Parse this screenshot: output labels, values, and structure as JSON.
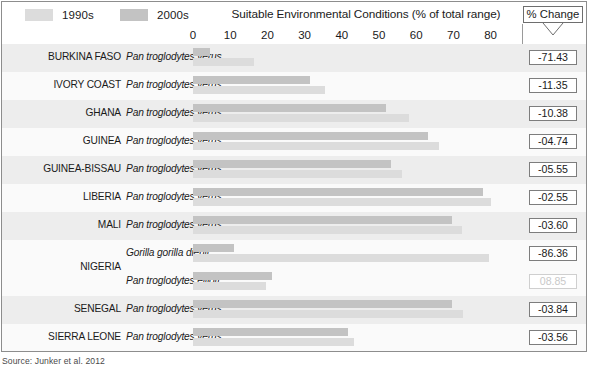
{
  "legend": {
    "items": [
      {
        "label": "1990s",
        "color": "#dcdcdc",
        "icon": "legend-swatch-1990s"
      },
      {
        "label": "2000s",
        "color": "#c3c3c3",
        "icon": "legend-swatch-2000s"
      }
    ]
  },
  "axis": {
    "title": "Suitable Environmental Conditions (% of total range)",
    "ticks": [
      "0",
      "10",
      "20",
      "30",
      "40",
      "50",
      "60",
      "70",
      "80"
    ]
  },
  "pct_column": {
    "header": "% Change",
    "chevron_icon": "chevron-down-icon"
  },
  "source": "Source: Junker et al. 2012",
  "chart_data": {
    "type": "bar",
    "title": "Suitable Environmental Conditions (% of total range)",
    "xlabel": "Suitable Environmental Conditions (% of total range)",
    "ylabel": "",
    "xlim": [
      0,
      80
    ],
    "xticks": [
      0,
      10,
      20,
      30,
      40,
      50,
      60,
      70,
      80
    ],
    "grid": false,
    "orientation": "horizontal",
    "legend": [
      "1990s",
      "2000s"
    ],
    "legend_position": "top-left",
    "series": [
      {
        "name": "1990s",
        "color": "#dcdcdc"
      },
      {
        "name": "2000s",
        "color": "#c3c3c3"
      }
    ],
    "rows": [
      {
        "country": "BURKINA FASO",
        "band": "shade",
        "entries": [
          {
            "species": "Pan troglodytes verus",
            "v1990": 16.4,
            "v2000": 4.7,
            "pct_change": "-71.43",
            "positive": false
          }
        ]
      },
      {
        "country": "IVORY COAST",
        "band": "plain",
        "entries": [
          {
            "species": "Pan troglodytes verus",
            "v1990": 35.5,
            "v2000": 31.5,
            "pct_change": "-11.35",
            "positive": false
          }
        ]
      },
      {
        "country": "GHANA",
        "band": "shade",
        "entries": [
          {
            "species": "Pan troglodytes verus",
            "v1990": 58.0,
            "v2000": 52.0,
            "pct_change": "-10.38",
            "positive": false
          }
        ]
      },
      {
        "country": "GUINEA",
        "band": "plain",
        "entries": [
          {
            "species": "Pan troglodytes verus",
            "v1990": 66.2,
            "v2000": 63.1,
            "pct_change": "-04.74",
            "positive": false
          }
        ]
      },
      {
        "country": "GUINEA-BISSAU",
        "band": "shade",
        "entries": [
          {
            "species": "Pan troglodytes verus",
            "v1990": 56.3,
            "v2000": 53.2,
            "pct_change": "-05.55",
            "positive": false
          }
        ]
      },
      {
        "country": "LIBERIA",
        "band": "plain",
        "entries": [
          {
            "species": "Pan troglodytes verus",
            "v1990": 80.0,
            "v2000": 77.9,
            "pct_change": "-02.55",
            "positive": false
          }
        ]
      },
      {
        "country": "MALI",
        "band": "shade",
        "entries": [
          {
            "species": "Pan troglodytes verus",
            "v1990": 72.3,
            "v2000": 69.7,
            "pct_change": "-03.60",
            "positive": false
          }
        ]
      },
      {
        "country": "NIGERIA",
        "band": "plain",
        "entries": [
          {
            "species": "Gorilla gorilla diehli",
            "v1990": 79.6,
            "v2000": 10.9,
            "pct_change": "-86.36",
            "positive": false
          },
          {
            "species": "Pan troglodytes ellioti",
            "v1990": 19.6,
            "v2000": 21.3,
            "pct_change": "08.85",
            "positive": true
          }
        ]
      },
      {
        "country": "SENEGAL",
        "band": "shade",
        "entries": [
          {
            "species": "Pan troglodytes verus",
            "v1990": 72.5,
            "v2000": 69.7,
            "pct_change": "-03.84",
            "positive": false
          }
        ]
      },
      {
        "country": "SIERRA LEONE",
        "band": "plain",
        "entries": [
          {
            "species": "Pan troglodytes verus",
            "v1990": 43.2,
            "v2000": 41.6,
            "pct_change": "-03.56",
            "positive": false
          }
        ]
      }
    ]
  }
}
